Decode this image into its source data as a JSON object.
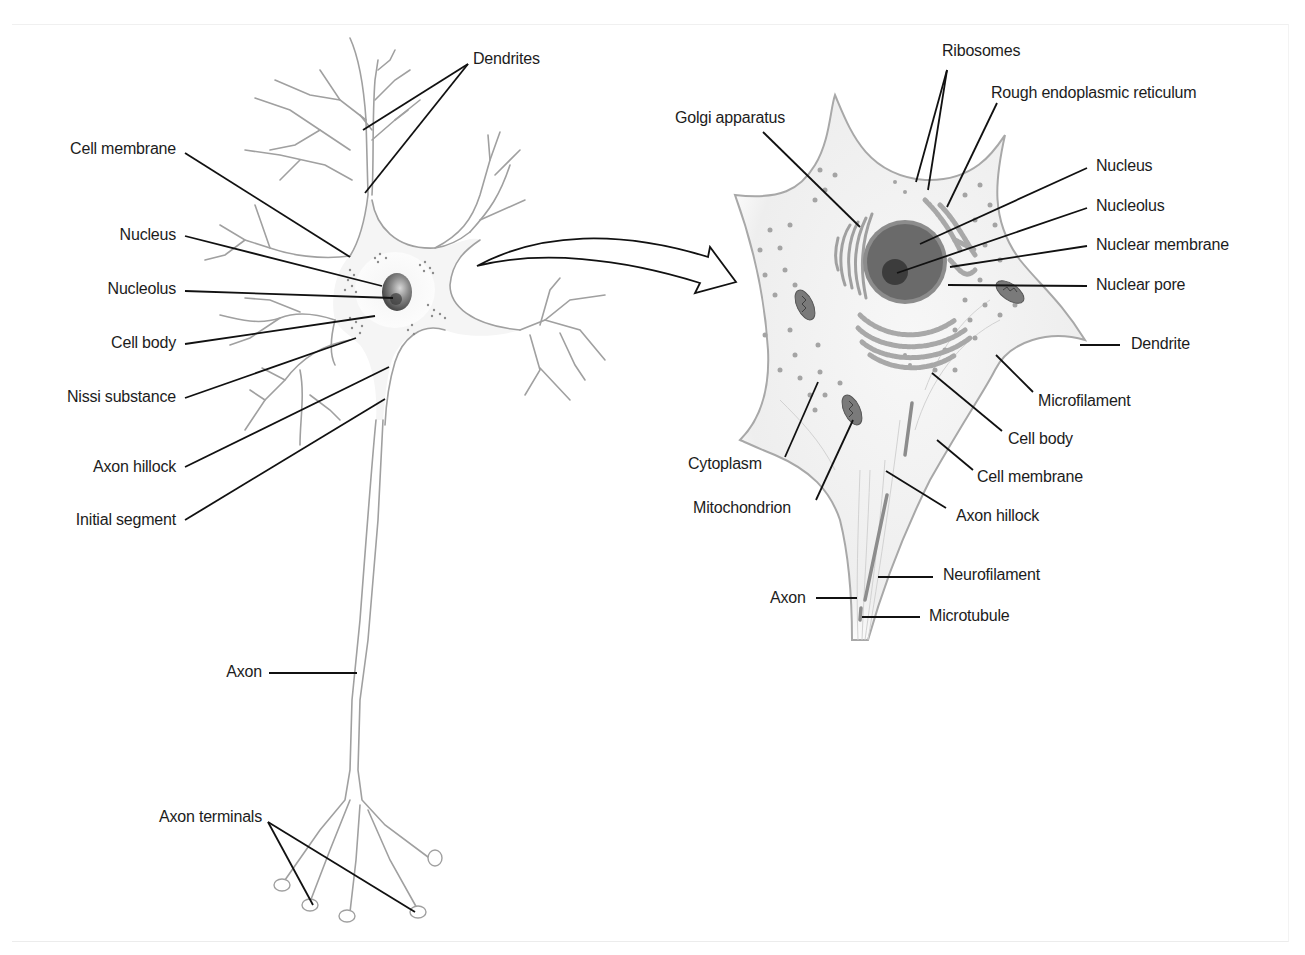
{
  "diagram": {
    "panels": [
      {
        "name": "whole-neuron",
        "description": "Multipolar neuron with dendrites, cell body, axon and axon terminals"
      },
      {
        "name": "cell-body-detail",
        "description": "Magnified cell body showing organelles"
      }
    ],
    "colors": {
      "outline": "#9a9a9a",
      "cytoplasm": "#f2f2f2",
      "nucleus": "#6e6e6e",
      "nucleolus": "#3e3e3e",
      "nuclear_membrane": "#8a8a8a",
      "organelle": "#a8a8a8",
      "leader_line": "#111111",
      "text": "#1c1c1c"
    }
  },
  "left_labels": {
    "dendrites": "Dendrites",
    "cell_membrane": "Cell membrane",
    "nucleus": "Nucleus",
    "nucleolus": "Nucleolus",
    "cell_body": "Cell body",
    "nissl_substance": "Nissi substance",
    "axon_hillock": "Axon hillock",
    "initial_segment": "Initial segment",
    "axon": "Axon",
    "axon_terminals": "Axon terminals"
  },
  "right_labels": {
    "ribosomes": "Ribosomes",
    "rough_er": "Rough endoplasmic reticulum",
    "golgi": "Golgi apparatus",
    "nucleus": "Nucleus",
    "nucleolus": "Nucleolus",
    "nuclear_membrane": "Nuclear membrane",
    "nuclear_pore": "Nuclear pore",
    "dendrite": "Dendrite",
    "microfilament": "Microfilament",
    "cell_body": "Cell body",
    "cytoplasm": "Cytoplasm",
    "cell_membrane": "Cell membrane",
    "mitochondrion": "Mitochondrion",
    "axon_hillock": "Axon hillock",
    "neurofilament": "Neurofilament",
    "axon": "Axon",
    "microtubule": "Microtubule"
  }
}
